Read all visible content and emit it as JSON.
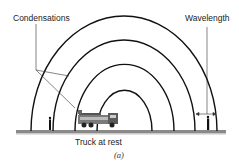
{
  "figure": {
    "labels": {
      "condensations": "Condensations",
      "wavelength": "Wavelength",
      "truck": "Truck at rest"
    },
    "caption": "(a)"
  },
  "diagram": {
    "type": "concentric-wavefronts",
    "source": "fire truck (stationary)",
    "wavefront_count": 4,
    "observers": 2,
    "colors": {
      "arcs": "#111111",
      "ground": "#8a8a8a",
      "text": "#222222"
    }
  }
}
